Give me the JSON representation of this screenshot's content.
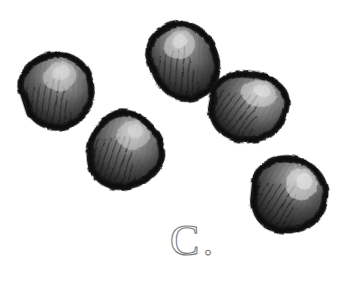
{
  "figure": {
    "caption_label": "C.",
    "medium": "pencil / ink hatched botanical illustration",
    "background_color": "#ffffff",
    "label_text_color": "#6b6b6b",
    "object_count": 5
  },
  "palette": {
    "paper": "#ffffff",
    "outline": "#171717",
    "shadow": "#262626",
    "fill_dark": "#3a3a3a",
    "fill_mid": "#555555",
    "fill_light": "#8a8a8a",
    "highlight": "#c9c9c9",
    "hatch": "#101010",
    "label_stroke": "#7a7a7a"
  },
  "objects": [
    {
      "name": "seed-top-left",
      "index": 1,
      "center_x": 57,
      "center_y": 91,
      "radius_x": 36,
      "radius_y": 35,
      "rotation": -18,
      "highlight_x": 64,
      "highlight_y": 78,
      "hatch_direction": "lower-left"
    },
    {
      "name": "seed-top-middle",
      "index": 2,
      "center_x": 183,
      "center_y": 62,
      "radius_x": 33,
      "radius_y": 38,
      "rotation": -22,
      "highlight_x": 188,
      "highlight_y": 46,
      "hatch_direction": "lower-left"
    },
    {
      "name": "seed-right-upper",
      "index": 3,
      "center_x": 248,
      "center_y": 107,
      "radius_x": 38,
      "radius_y": 34,
      "rotation": 10,
      "highlight_x": 259,
      "highlight_y": 93,
      "hatch_direction": "lower-left"
    },
    {
      "name": "seed-center-lower",
      "index": 4,
      "center_x": 126,
      "center_y": 150,
      "radius_x": 38,
      "radius_y": 38,
      "rotation": -8,
      "highlight_x": 138,
      "highlight_y": 137,
      "hatch_direction": "lower-left"
    },
    {
      "name": "seed-bottom-right",
      "index": 5,
      "center_x": 288,
      "center_y": 195,
      "radius_x": 37,
      "radius_y": 37,
      "rotation": 6,
      "highlight_x": 302,
      "highlight_y": 180,
      "hatch_direction": "lower-left"
    }
  ],
  "label": {
    "letter": "C",
    "period": ".",
    "x": 170,
    "y": 254,
    "font_size": 40
  }
}
